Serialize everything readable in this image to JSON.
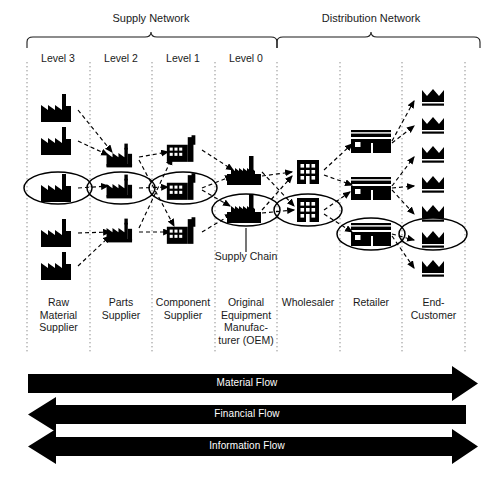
{
  "diagram": {
    "network_labels": [
      {
        "name": "supply-network",
        "label": "Supply Network",
        "x_start": 27,
        "x_end": 277,
        "tip_x": 151
      },
      {
        "name": "distribution-network",
        "label": "Distribution Network",
        "x_start": 277,
        "x_end": 480,
        "tip_x": 371
      }
    ],
    "levels": [
      {
        "name": "level-3",
        "label": "Level 3",
        "center_x": 58
      },
      {
        "name": "level-2",
        "label": "Level 2",
        "center_x": 121
      },
      {
        "name": "level-1",
        "label": "Level 1",
        "center_x": 183
      },
      {
        "name": "level-0",
        "label": "Level 0",
        "center_x": 246
      }
    ],
    "column_dividers": [
      27,
      90,
      152,
      215,
      277,
      340,
      402,
      465
    ],
    "columns": [
      {
        "name": "raw-material-supplier",
        "label": "Raw\nMaterial\nSupplier",
        "icon": "factory-icon",
        "center_x": 58,
        "nodes_y": [
          108,
          141,
          188,
          233,
          266
        ],
        "count": 5
      },
      {
        "name": "parts-supplier",
        "label": "Parts\nSupplier",
        "icon": "factory-icon",
        "center_x": 121,
        "nodes_y": [
          157,
          188,
          232
        ],
        "count": 3
      },
      {
        "name": "component-supplier",
        "label": "Component\nSupplier",
        "icon": "factory-windows-icon",
        "center_x": 183,
        "nodes_y": [
          150,
          188,
          232
        ],
        "count": 3
      },
      {
        "name": "original-equipment-manufacturer",
        "label": "Original\nEquipment\nManufac-\nturer (OEM)",
        "icon": "plant-icon",
        "center_x": 246,
        "nodes_y": [
          172,
          210
        ],
        "count": 2
      },
      {
        "name": "wholesaler",
        "label": "Wholesaler",
        "icon": "office-building-icon",
        "center_x": 308,
        "nodes_y": [
          172,
          210
        ],
        "count": 2
      },
      {
        "name": "retailer",
        "label": "Retailer",
        "icon": "store-icon",
        "center_x": 371,
        "nodes_y": [
          141,
          188,
          234
        ],
        "count": 3
      },
      {
        "name": "end-customer",
        "label": "End-\nCustomer",
        "icon": "crown-icon",
        "center_x": 433,
        "nodes_y": [
          98,
          126,
          155,
          185,
          214,
          240,
          269
        ],
        "count": 7
      }
    ],
    "supply_chain_annotation": {
      "label": "Supply Chain",
      "leader_from_x": 246,
      "leader_from_y": 228,
      "leader_to_y": 252,
      "text_x": 246,
      "text_y": 254
    },
    "chain_highlights": [
      {
        "name": "highlight-raw-material",
        "cx": 58,
        "cy": 188,
        "rx": 34,
        "ry": 16
      },
      {
        "name": "highlight-parts",
        "cx": 121,
        "cy": 188,
        "rx": 34,
        "ry": 16
      },
      {
        "name": "highlight-component",
        "cx": 183,
        "cy": 188,
        "rx": 34,
        "ry": 16
      },
      {
        "name": "highlight-oem",
        "cx": 246,
        "cy": 210,
        "rx": 34,
        "ry": 16
      },
      {
        "name": "highlight-wholesaler",
        "cx": 308,
        "cy": 210,
        "rx": 34,
        "ry": 16
      },
      {
        "name": "highlight-retailer",
        "cx": 371,
        "cy": 234,
        "rx": 34,
        "ry": 16
      },
      {
        "name": "highlight-end-customer",
        "cx": 433,
        "cy": 234,
        "rx": 34,
        "ry": 16
      }
    ],
    "flows": [
      {
        "name": "material-flow",
        "label": "Material Flow",
        "direction": "right",
        "y": 383,
        "color": "#000000"
      },
      {
        "name": "financial-flow",
        "label": "Financial Flow",
        "direction": "left",
        "y": 414,
        "color": "#000000"
      },
      {
        "name": "information-flow",
        "label": "Information Flow",
        "direction": "both",
        "y": 446,
        "color": "#000000"
      }
    ],
    "colors": {
      "ink": "#000000",
      "text": "#1a1a1a",
      "divider": "#9a9a9a",
      "arrow_label": "#ffffff",
      "background": "#ffffff"
    }
  }
}
